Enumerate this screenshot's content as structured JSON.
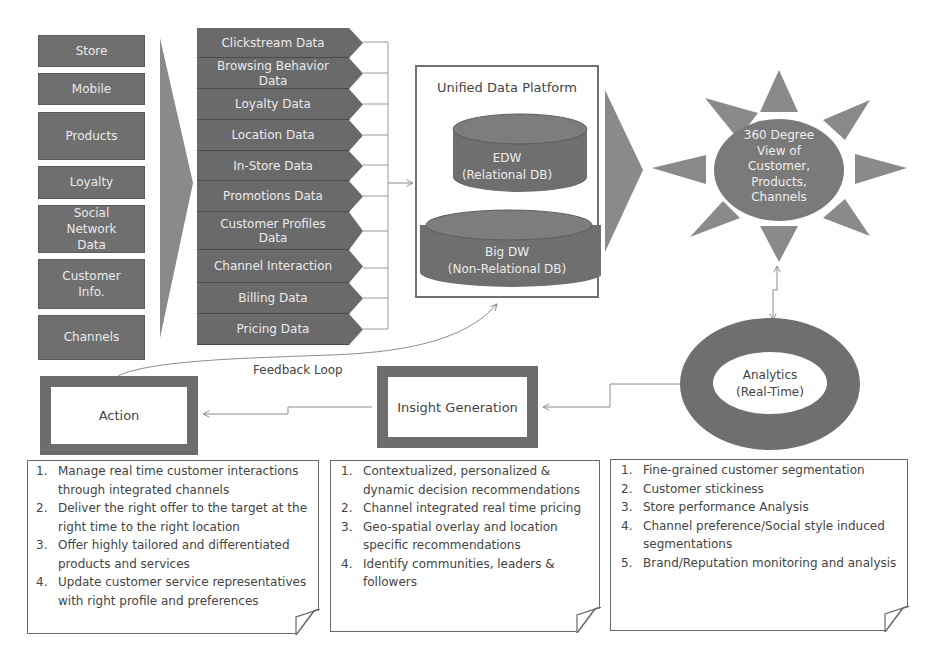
{
  "sources": [
    {
      "label": "Store"
    },
    {
      "label": "Mobile"
    },
    {
      "label": "Products"
    },
    {
      "label": "Loyalty"
    },
    {
      "label": "Social Network Data"
    },
    {
      "label": "Customer Info."
    },
    {
      "label": "Channels"
    }
  ],
  "data_types": [
    {
      "label": "Clickstream Data"
    },
    {
      "label": "Browsing Behavior Data"
    },
    {
      "label": "Loyalty Data"
    },
    {
      "label": "Location Data"
    },
    {
      "label": "In-Store Data"
    },
    {
      "label": "Promotions Data"
    },
    {
      "label": "Customer Profiles Data"
    },
    {
      "label": "Channel Interaction"
    },
    {
      "label": "Billing Data"
    },
    {
      "label": "Pricing Data"
    }
  ],
  "platform": {
    "title": "Unified Data Platform",
    "edw": {
      "line1": "EDW",
      "line2": "(Relational DB)"
    },
    "bigdw": {
      "line1": "Big DW",
      "line2": "(Non-Relational DB)"
    }
  },
  "view360": {
    "lines": [
      "360 Degree",
      "View of",
      "Customer,",
      "Products,",
      "Channels"
    ]
  },
  "analytics": {
    "line1": "Analytics",
    "line2": "(Real-Time)"
  },
  "insight": {
    "label": "Insight Generation"
  },
  "action": {
    "label": "Action"
  },
  "feedback": {
    "label": "Feedback Loop"
  },
  "notes": {
    "action": [
      {
        "num": "1.",
        "text": "Manage real time customer interactions through integrated channels"
      },
      {
        "num": "2.",
        "text": "Deliver the right offer to the target at the right time to the right location"
      },
      {
        "num": "3.",
        "text": "Offer highly tailored and differentiated products and services"
      },
      {
        "num": "4.",
        "text": "Update customer service representatives with right profile and preferences"
      }
    ],
    "insight": [
      {
        "num": "1.",
        "text": "Contextualized, personalized & dynamic decision recommendations"
      },
      {
        "num": "2.",
        "text": "Channel integrated real time pricing"
      },
      {
        "num": "3.",
        "text": "Geo-spatial overlay and location specific recommendations"
      },
      {
        "num": "4.",
        "text": "Identify communities, leaders & followers"
      }
    ],
    "analytics": [
      {
        "num": "1.",
        "text": "Fine-grained customer segmentation"
      },
      {
        "num": "2.",
        "text": "Customer stickiness"
      },
      {
        "num": "3.",
        "text": "Store performance Analysis"
      },
      {
        "num": "4.",
        "text": "Channel preference/Social style induced segmentations"
      },
      {
        "num": "5.",
        "text": "Brand/Reputation monitoring and analysis"
      }
    ]
  },
  "colors": {
    "shape_fill": "#6d6d6d",
    "light_fill": "#8a8a8a",
    "line": "#8c8c8c",
    "text_light": "#eeeeee",
    "text_dark": "#444444"
  }
}
